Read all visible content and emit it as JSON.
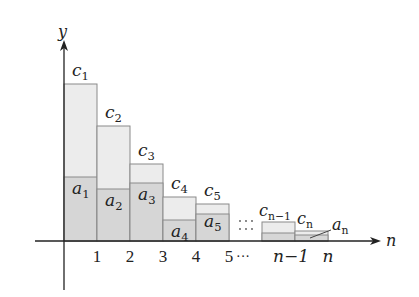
{
  "diagram": {
    "title": "",
    "axes": {
      "x_label": "n",
      "y_label": "y",
      "origin": [
        64,
        241
      ],
      "x_end": 381,
      "y_top": 40,
      "y_bottom": 290,
      "x_start": 35
    },
    "colors": {
      "axis": "#222222",
      "c_fill": "#ececec",
      "a_fill": "#d6d6d6",
      "stroke": "#8a8a8a",
      "text": "#222222"
    },
    "bars": [
      {
        "index": "1",
        "x": 64,
        "w": 33,
        "c_top": 84,
        "a_top": 177,
        "c_label": "c",
        "c_sub": "1",
        "a_label": "a",
        "a_sub": "1"
      },
      {
        "index": "2",
        "x": 97,
        "w": 33,
        "c_top": 126,
        "a_top": 189,
        "c_label": "c",
        "c_sub": "2",
        "a_label": "a",
        "a_sub": "2"
      },
      {
        "index": "3",
        "x": 130,
        "w": 33,
        "c_top": 164,
        "a_top": 183,
        "c_label": "c",
        "c_sub": "3",
        "a_label": "a",
        "a_sub": "3"
      },
      {
        "index": "4",
        "x": 163,
        "w": 33,
        "c_top": 197,
        "a_top": 220,
        "c_label": "c",
        "c_sub": "4",
        "a_label": "a",
        "a_sub": "4"
      },
      {
        "index": "5",
        "x": 196,
        "w": 33,
        "c_top": 204,
        "a_top": 214,
        "c_label": "c",
        "c_sub": "5",
        "a_label": "a",
        "a_sub": "5"
      },
      {
        "index": "n-1",
        "x": 262,
        "w": 33,
        "c_top": 222,
        "a_top": 233,
        "c_label": "c",
        "c_sub": "n−1",
        "a_label": "",
        "a_sub": ""
      },
      {
        "index": "n",
        "x": 295,
        "w": 33,
        "c_top": 231,
        "a_top": 235,
        "c_label": "c",
        "c_sub": "n",
        "a_label": "a",
        "a_sub": "n"
      }
    ],
    "tick_labels": [
      {
        "text": "1",
        "x": 97
      },
      {
        "text": "2",
        "x": 130
      },
      {
        "text": "3",
        "x": 163
      },
      {
        "text": "4",
        "x": 196
      },
      {
        "text": "5",
        "x": 229
      },
      {
        "text": "n−1",
        "x": 291
      },
      {
        "text": "n",
        "x": 328
      }
    ],
    "ellipsis_axis": "···",
    "ellipsis_grid": "⋮⋮"
  }
}
